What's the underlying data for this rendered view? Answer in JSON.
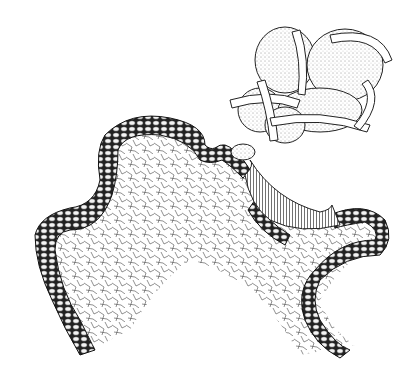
{
  "figure": {
    "background": "#ffffff",
    "ink": "#1a1a1a",
    "subjects": [
      {
        "name": "thallus-cross-section",
        "description": "lichen thallus cross-section with algal layer and fungal hyphae medulla"
      },
      {
        "name": "soredium",
        "description": "cluster of algal cells wrapped by fungal hyphae"
      }
    ]
  }
}
